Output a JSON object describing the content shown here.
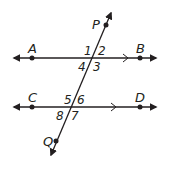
{
  "diagram": {
    "colors": {
      "stroke": "#231f20",
      "background": "#ffffff"
    },
    "lines": [
      {
        "id": "AB",
        "points": [
          "A",
          "B"
        ],
        "parallel_marker": ">"
      },
      {
        "id": "CD",
        "points": [
          "C",
          "D"
        ],
        "parallel_marker": ">"
      },
      {
        "id": "PQ",
        "points": [
          "P",
          "Q"
        ],
        "role": "transversal"
      }
    ],
    "points": {
      "A": "A",
      "B": "B",
      "C": "C",
      "D": "D",
      "P": "P",
      "Q": "Q"
    },
    "angles": {
      "a1": "1",
      "a2": "2",
      "a3": "3",
      "a4": "4",
      "a5": "5",
      "a6": "6",
      "a7": "7",
      "a8": "8"
    }
  }
}
